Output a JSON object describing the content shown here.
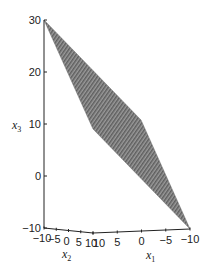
{
  "chart_data": {
    "type": "surface3d",
    "title": "",
    "axes": {
      "x1": {
        "label": "x",
        "subscript": "1",
        "range": [
          10,
          -10
        ],
        "ticks": [
          10,
          5,
          0,
          -5,
          -10
        ]
      },
      "x2": {
        "label": "x",
        "subscript": "2",
        "range": [
          -10,
          10
        ],
        "ticks": [
          -10,
          -5,
          0,
          5,
          10
        ]
      },
      "x3": {
        "label": "x",
        "subscript": "3",
        "range": [
          -10,
          30
        ],
        "ticks": [
          -10,
          0,
          10,
          20,
          30
        ]
      }
    },
    "surface": {
      "description": "Planar quadrilateral patch (shaded, hatched)",
      "vertices_x1_x2_x3": [
        [
          10,
          -10,
          30
        ],
        [
          10,
          10,
          10
        ],
        [
          -10,
          -10,
          10
        ],
        [
          -10,
          10,
          -10
        ]
      ],
      "fill_color": "#8a8a8a"
    },
    "grid": false,
    "legend": "none"
  }
}
